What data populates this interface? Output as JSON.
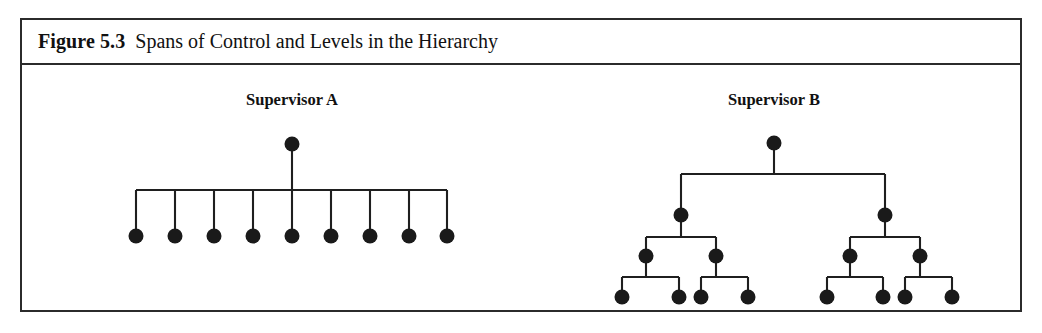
{
  "figure": {
    "label": "Figure 5.3",
    "title": "Spans of Control and Levels in the Hierarchy",
    "border_color": "#2b2b2b",
    "background_color": "#ffffff",
    "node_color": "#1a1a1a",
    "line_color": "#1f1f1f"
  },
  "diagrams": [
    {
      "id": "supervisor-a",
      "heading": "Supervisor A",
      "heading_x": 270,
      "heading_y": 40,
      "type": "flat-span",
      "levels": 2,
      "span_of_control": 9,
      "root": {
        "x": 270,
        "y": 79
      },
      "bus_y": 125,
      "leaf_y": 171,
      "leaf_count": 9,
      "leaves_x": [
        114,
        153,
        192,
        231,
        270,
        309,
        348,
        387,
        425
      ],
      "node_radius": 7.5
    },
    {
      "id": "supervisor-b",
      "heading": "Supervisor B",
      "heading_x": 752,
      "heading_y": 40,
      "type": "binary-hierarchy",
      "levels": 4,
      "span_of_control": 2,
      "node_radius": 7.5,
      "rows": [
        {
          "level": 1,
          "y": 78,
          "x": [
            752
          ]
        },
        {
          "level": 2,
          "y": 150,
          "x": [
            659,
            863
          ]
        },
        {
          "level": 3,
          "y": 191,
          "x": [
            624,
            694,
            828,
            898
          ]
        },
        {
          "level": 4,
          "y": 232,
          "x": [
            600,
            657,
            679,
            726,
            805,
            861,
            883,
            930
          ]
        }
      ],
      "bus_rows": [
        {
          "from_level": 1,
          "bus_y": 109,
          "parent_x": 752,
          "child_x": [
            659,
            863
          ]
        },
        {
          "from_level": 2,
          "bus_y": 172,
          "parent_x": 659,
          "child_x": [
            624,
            694
          ]
        },
        {
          "from_level": 2,
          "bus_y": 172,
          "parent_x": 863,
          "child_x": [
            828,
            898
          ]
        },
        {
          "from_level": 3,
          "bus_y": 212,
          "parent_x": 624,
          "child_x": [
            600,
            657
          ]
        },
        {
          "from_level": 3,
          "bus_y": 212,
          "parent_x": 694,
          "child_x": [
            679,
            726
          ]
        },
        {
          "from_level": 3,
          "bus_y": 212,
          "parent_x": 828,
          "child_x": [
            805,
            861
          ]
        },
        {
          "from_level": 3,
          "bus_y": 212,
          "parent_x": 898,
          "child_x": [
            883,
            930
          ]
        }
      ]
    }
  ],
  "chart_data": {
    "type": "diagram",
    "title": "Spans of Control and Levels in the Hierarchy",
    "series": [
      {
        "name": "Supervisor A",
        "levels": 2,
        "span_of_control": 9,
        "total_nodes": 10,
        "nodes_per_level": [
          1,
          9
        ]
      },
      {
        "name": "Supervisor B",
        "levels": 4,
        "span_of_control": 2,
        "total_nodes": 15,
        "nodes_per_level": [
          1,
          2,
          4,
          8
        ]
      }
    ]
  }
}
